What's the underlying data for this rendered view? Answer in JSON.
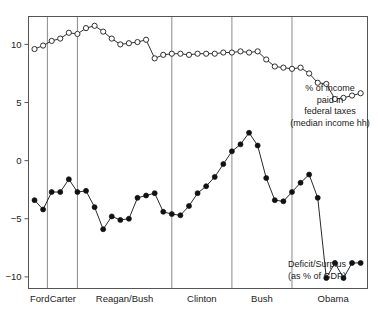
{
  "chart_data": {
    "type": "line",
    "title": "",
    "xlabel": "",
    "ylabel": "",
    "ylim": [
      -11,
      12.4
    ],
    "xlim": [
      1973.3,
      2012.8
    ],
    "yticks": [
      -10,
      -5,
      0,
      5,
      10
    ],
    "ytick_labels": [
      "−10",
      "−5",
      "0",
      "5",
      "10"
    ],
    "grid": false,
    "legend_position": "inline-annotation",
    "annotations": [
      {
        "name": "taxes-annotation",
        "text": "% of income\npaid in\nfederal taxes\n(median income hh)",
        "lines": [
          "% of income",
          "paid in",
          "federal taxes",
          "(median income hh)"
        ]
      },
      {
        "name": "deficit-annotation",
        "text": "Deficit/Surplus\n(as % of GDP)",
        "lines": [
          "Deficit/Surplus",
          "(as % of GDP)"
        ]
      }
    ],
    "era_dividers_x": [
      1975.5,
      1979.0,
      1990.0,
      1997.0,
      2004.0
    ],
    "eras": [
      {
        "label": "Ford",
        "x_center": 1974.6
      },
      {
        "label": "Carter",
        "x_center": 1977.3
      },
      {
        "label": "Reagan/Bush",
        "x_center": 1984.5
      },
      {
        "label": "Clinton",
        "x_center": 1993.5
      },
      {
        "label": "Bush",
        "x_center": 2000.5
      },
      {
        "label": "Obama",
        "x_center": 2008.8
      }
    ],
    "series": [
      {
        "name": "% of income paid in federal taxes (median income hh)",
        "marker": "open-circle",
        "color": "#1a1a1a",
        "x": [
          1974,
          1975,
          1976,
          1977,
          1978,
          1979,
          1980,
          1981,
          1982,
          1983,
          1984,
          1985,
          1986,
          1987,
          1988,
          1989,
          1990,
          1991,
          1992,
          1993,
          1994,
          1995,
          1996,
          1997,
          1998,
          1999,
          2000,
          2001,
          2002,
          2003,
          2004,
          2005,
          2006,
          2007,
          2008,
          2009,
          2010,
          2011,
          2012
        ],
        "values": [
          9.6,
          9.9,
          10.3,
          10.5,
          11.0,
          10.9,
          11.4,
          11.6,
          11.1,
          10.5,
          10.0,
          10.1,
          10.2,
          10.4,
          8.8,
          9.1,
          9.2,
          9.2,
          9.1,
          9.2,
          9.2,
          9.2,
          9.3,
          9.3,
          9.4,
          9.3,
          9.4,
          8.7,
          8.1,
          8.0,
          7.9,
          8.0,
          7.5,
          6.7,
          6.6,
          5.3,
          5.4,
          5.6,
          5.8
        ]
      },
      {
        "name": "Deficit/Surplus (as % of GDP)",
        "marker": "filled-circle",
        "color": "#111111",
        "x": [
          1974,
          1975,
          1976,
          1977,
          1978,
          1979,
          1980,
          1981,
          1982,
          1983,
          1984,
          1985,
          1986,
          1987,
          1988,
          1989,
          1990,
          1991,
          1992,
          1993,
          1994,
          1995,
          1996,
          1997,
          1998,
          1999,
          2000,
          2001,
          2002,
          2003,
          2004,
          2005,
          2006,
          2007,
          2008,
          2009,
          2010,
          2011,
          2012
        ],
        "values": [
          -3.4,
          -4.2,
          -2.7,
          -2.7,
          -1.6,
          -2.7,
          -2.6,
          -4.0,
          -5.9,
          -4.8,
          -5.1,
          -5.0,
          -3.2,
          -3.0,
          -2.8,
          -4.4,
          -4.6,
          -4.7,
          -3.9,
          -2.8,
          -2.2,
          -1.4,
          -0.3,
          0.8,
          1.4,
          2.4,
          1.3,
          -1.5,
          -3.4,
          -3.5,
          -2.7,
          -1.9,
          -1.2,
          -3.2,
          -10.1,
          -8.8,
          -10.1,
          -8.8,
          -8.8
        ]
      }
    ]
  },
  "yaxis": {
    "name": "y-axis"
  },
  "xaxis": {
    "name": "x-axis"
  }
}
